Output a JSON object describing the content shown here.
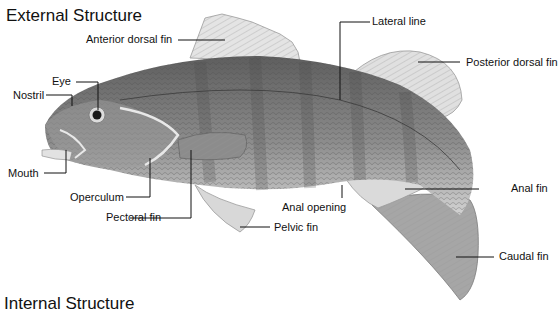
{
  "titles": {
    "external": "External Structure",
    "internal": "Internal Structure"
  },
  "labels": {
    "anterior_dorsal_fin": "Anterior dorsal fin",
    "lateral_line": "Lateral line",
    "posterior_dorsal_fin": "Posterior dorsal fin",
    "eye": "Eye",
    "nostril": "Nostril",
    "mouth": "Mouth",
    "operculum": "Operculum",
    "pectoral_fin": "Pectoral fin",
    "pelvic_fin": "Pelvic fin",
    "anal_opening": "Anal opening",
    "anal_fin": "Anal fin",
    "caudal_fin": "Caudal fin"
  },
  "colors": {
    "body_dark": "#6f6f6f",
    "body_light": "#bdbdbd",
    "fin": "#d6d6d6",
    "leader_line": "#111111"
  }
}
